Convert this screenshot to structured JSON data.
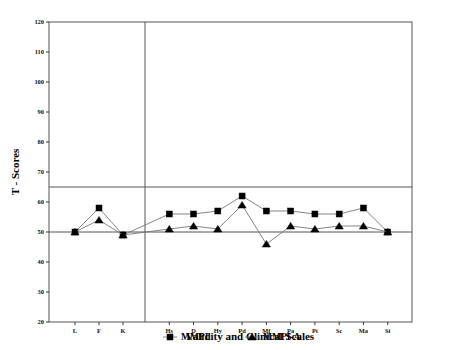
{
  "chart_data": {
    "type": "line",
    "title": "",
    "xlabel": "Validity and Clinical Scales",
    "ylabel": "T - Scores",
    "categories": [
      "L",
      "F",
      "K",
      "Hs",
      "D",
      "Hy",
      "Pd",
      "Mf",
      "Pa",
      "Pt",
      "Sc",
      "Ma",
      "Si"
    ],
    "series": [
      {
        "name": "MMPI",
        "marker": "square",
        "values": [
          50,
          58,
          49,
          56,
          56,
          57,
          62,
          57,
          57,
          56,
          56,
          58,
          50
        ]
      },
      {
        "name": "MMPI-A",
        "marker": "triangle",
        "values": [
          50,
          54,
          49,
          51,
          52,
          51,
          59,
          46,
          52,
          51,
          52,
          52,
          50
        ]
      }
    ],
    "ylim": [
      20,
      120
    ],
    "yticks": [
      20,
      30,
      40,
      50,
      60,
      70,
      80,
      90,
      100,
      110,
      120
    ],
    "ytick_labels": [
      "20",
      "30",
      "40",
      "50",
      "60",
      "70",
      "80",
      "90",
      "100",
      "110",
      "120"
    ],
    "reference_lines": [
      {
        "value": 65,
        "orientation": "horizontal"
      },
      {
        "value": 50,
        "orientation": "horizontal"
      }
    ],
    "group_divider_after": "K",
    "grid": false,
    "legend_position": "bottom",
    "legend": [
      {
        "label": "MMPI",
        "marker": "square"
      },
      {
        "label": "MMPI-A",
        "marker": "triangle"
      }
    ]
  },
  "axes": {
    "y_axis_title": "T - Scores",
    "x_axis_title": "Validity and Clinical Scales"
  },
  "colors": {
    "line": "#777777",
    "marker": "#000000",
    "frame": "#555555",
    "text": "#000000",
    "background": "#ffffff"
  }
}
